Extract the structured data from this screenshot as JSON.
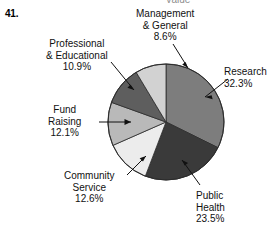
{
  "exercise": {
    "number": "41."
  },
  "clipped_heading": "Value",
  "chart_data": {
    "type": "pie",
    "title": "",
    "subtitle": "",
    "xlabel": "",
    "ylabel": "",
    "legend_position": "none",
    "grid": false,
    "labels_outside": true,
    "units": "percent",
    "categories": [
      "Research",
      "Public Health",
      "Community Service",
      "Fund Raising",
      "Professional & Educational",
      "Management & General"
    ],
    "values": [
      32.3,
      23.5,
      12.6,
      12.1,
      10.9,
      8.6
    ],
    "value_labels": [
      "32.3%",
      "23.5%",
      "12.6%",
      "12.1%",
      "10.9%",
      "8.6%"
    ],
    "colors": [
      "#7d7d7d",
      "#3a3a3a",
      "#ececec",
      "#b9b9b9",
      "#5e5e5e",
      "#d2d2d2"
    ],
    "start_angle_deg": 0,
    "direction": "clockwise",
    "total": 100.0,
    "slices": [
      {
        "name": "Research",
        "value": 32.3,
        "value_label": "32.3%",
        "color": "#7d7d7d",
        "label_lines": [
          "Research",
          "32.3%"
        ]
      },
      {
        "name": "Public Health",
        "value": 23.5,
        "value_label": "23.5%",
        "color": "#3a3a3a",
        "label_lines": [
          "Public",
          "Health",
          "23.5%"
        ]
      },
      {
        "name": "Community Service",
        "value": 12.6,
        "value_label": "12.6%",
        "color": "#ececec",
        "label_lines": [
          "Community",
          "Service",
          "12.6%"
        ]
      },
      {
        "name": "Fund Raising",
        "value": 12.1,
        "value_label": "12.1%",
        "color": "#b9b9b9",
        "label_lines": [
          "Fund",
          "Raising",
          "12.1%"
        ]
      },
      {
        "name": "Professional & Educational",
        "value": 10.9,
        "value_label": "10.9%",
        "color": "#5e5e5e",
        "label_lines": [
          "Professional",
          "& Educational",
          "10.9%"
        ]
      },
      {
        "name": "Management & General",
        "value": 8.6,
        "value_label": "8.6%",
        "color": "#d2d2d2",
        "label_lines": [
          "Management",
          "& General",
          "8.6%"
        ]
      }
    ]
  }
}
